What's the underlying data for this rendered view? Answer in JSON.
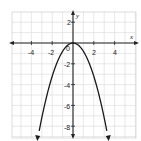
{
  "chart_data": {
    "type": "line",
    "title": "",
    "xlabel": "x",
    "ylabel": "y",
    "xlim": [
      -6,
      6
    ],
    "ylim": [
      -9,
      3
    ],
    "grid": true,
    "x_ticks": [
      -4,
      -2,
      2,
      4
    ],
    "y_ticks": [
      2,
      -2,
      -4,
      -6,
      -8
    ],
    "origin_label": "0",
    "series": [
      {
        "name": "parabola",
        "equation": "y = -0.8x^2",
        "x": [
          -3.35,
          -3,
          -2,
          -1,
          0,
          1,
          2,
          3,
          3.35
        ],
        "y": [
          -9,
          -7.2,
          -3.2,
          -0.8,
          0,
          -0.8,
          -3.2,
          -7.2,
          -9
        ]
      }
    ]
  },
  "labels": {
    "x_axis": "x",
    "y_axis": "y",
    "origin": "0",
    "xt": [
      "-4",
      "-2",
      "2",
      "4"
    ],
    "yt": [
      "2",
      "-2",
      "-4",
      "-6",
      "-8"
    ]
  }
}
